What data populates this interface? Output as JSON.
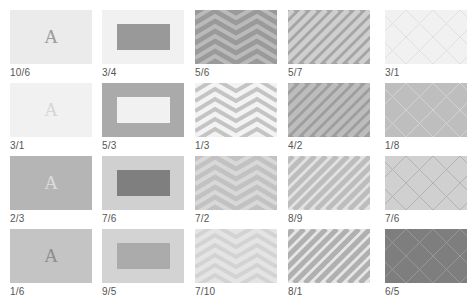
{
  "grid": {
    "columns": 5,
    "rows": 4,
    "tiles": [
      {
        "type": "letter",
        "label": "10/6",
        "bg": "#ebebeb",
        "fg": "#9c9c9c",
        "letter": "A"
      },
      {
        "type": "rect",
        "label": "3/4",
        "bg": "#f1f1f1",
        "fg": "#999999"
      },
      {
        "type": "chevron",
        "label": "5/6",
        "bg": "#9a9a9a",
        "fg": "#bababa"
      },
      {
        "type": "diagonal",
        "label": "5/7",
        "bg": "#a5a5a5",
        "fg": "#cfcfcf"
      },
      {
        "type": "lattice",
        "label": "3/1",
        "bg": "#f1f1f1",
        "fg": "#e0e0e0"
      },
      {
        "type": "letter",
        "label": "3/1",
        "bg": "#f1f1f1",
        "fg": "#d6d6d6",
        "letter": "A"
      },
      {
        "type": "rect",
        "label": "5/3",
        "bg": "#aaaaaa",
        "fg": "#f1f1f1"
      },
      {
        "type": "chevron",
        "label": "1/3",
        "bg": "#f3f3f3",
        "fg": "#c4c4c4"
      },
      {
        "type": "diagonal",
        "label": "4/2",
        "bg": "#9e9e9e",
        "fg": "#bdbdbd"
      },
      {
        "type": "lattice",
        "label": "1/8",
        "bg": "#bebebe",
        "fg": "#d2d2d2"
      },
      {
        "type": "letter",
        "label": "2/3",
        "bg": "#b5b5b5",
        "fg": "#dcdcdc",
        "letter": "A"
      },
      {
        "type": "rect",
        "label": "7/6",
        "bg": "#d0d0d0",
        "fg": "#7f7f7f"
      },
      {
        "type": "chevron",
        "label": "7/2",
        "bg": "#c2c2c2",
        "fg": "#d8d8d8"
      },
      {
        "type": "diagonal",
        "label": "8/9",
        "bg": "#e2e2e2",
        "fg": "#bdbdbd"
      },
      {
        "type": "lattice",
        "label": "7/6",
        "bg": "#d0d0d0",
        "fg": "#b3b3b3"
      },
      {
        "type": "letter",
        "label": "1/6",
        "bg": "#c4c4c4",
        "fg": "#8e8e8e",
        "letter": "A"
      },
      {
        "type": "rect",
        "label": "9/5",
        "bg": "#d3d3d3",
        "fg": "#ababab"
      },
      {
        "type": "chevron",
        "label": "7/10",
        "bg": "#e4e4e4",
        "fg": "#d3d3d3"
      },
      {
        "type": "diagonal",
        "label": "8/1",
        "bg": "#e6e6e6",
        "fg": "#b0b0b0"
      },
      {
        "type": "lattice",
        "label": "6/5",
        "bg": "#7e7e7e",
        "fg": "#979797"
      }
    ]
  }
}
